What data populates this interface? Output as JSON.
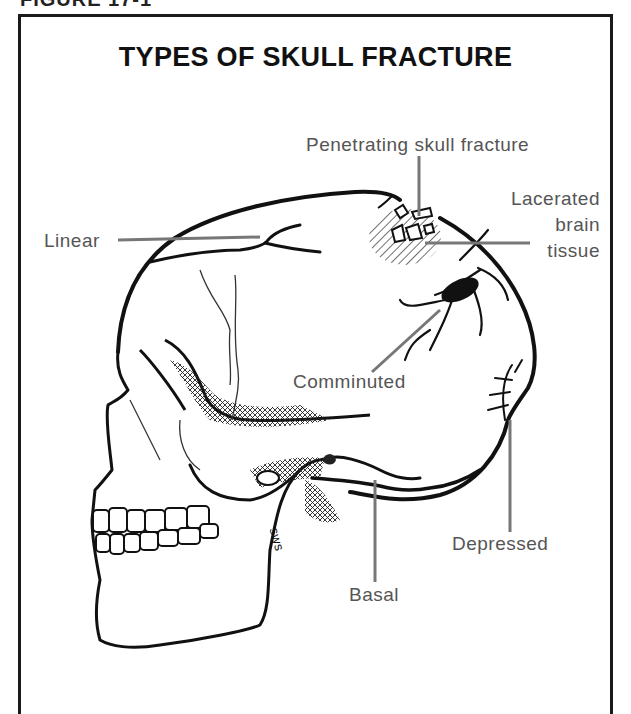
{
  "figure": {
    "heading_partial": "FIGURE 17-1",
    "title": "TYPES OF SKULL FRACTURE"
  },
  "labels": {
    "penetrating": "Penetrating skull fracture",
    "lacerated_line1": "Lacerated",
    "lacerated_line2": "brain",
    "lacerated_line3": "tissue",
    "linear": "Linear",
    "comminuted": "Comminuted",
    "depressed": "Depressed",
    "basal": "Basal",
    "suture_mark": "sws"
  },
  "colors": {
    "ink": "#111111",
    "label": "#555555",
    "leader": "#777777",
    "frame": "#1a1a1a"
  }
}
